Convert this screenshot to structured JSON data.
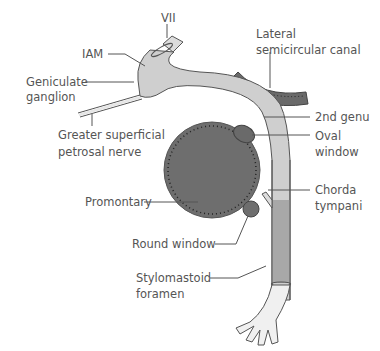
{
  "diagram": {
    "colors": {
      "nerve_fill": "#cfcfcf",
      "nerve_stroke": "#555555",
      "promontory_fill": "#6e6e6e",
      "canal_fill": "#6a6a6a",
      "label_text": "#555555",
      "background": "#ffffff"
    },
    "labels": {
      "vii": "VII",
      "iam": "IAM",
      "geniculate_line1": "Geniculate",
      "geniculate_line2": "ganglion",
      "gspn_line1": "Greater superficial",
      "gspn_line2": "petrosal nerve",
      "lscc_line1": "Lateral",
      "lscc_line2": "semicircular canal",
      "second_genu": "2nd genu",
      "oval_line1": "Oval",
      "oval_line2": "window",
      "promontory": "Promontary",
      "chorda_line1": "Chorda",
      "chorda_line2": "tympani",
      "round_window": "Round window",
      "stylo_line1": "Stylomastoid",
      "stylo_line2": "foramen"
    }
  }
}
